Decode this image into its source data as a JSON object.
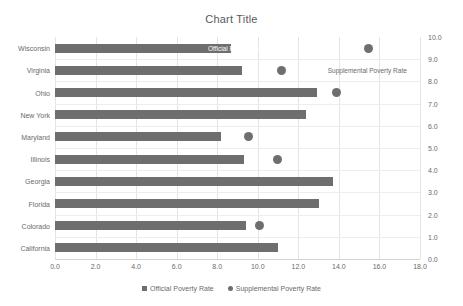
{
  "chart_data": {
    "type": "bar",
    "title": "Chart Title",
    "orientation": "horizontal",
    "xlabel": "",
    "ylabel": "",
    "grid": true,
    "legend_position": "bottom",
    "categories": [
      "Wisconsin",
      "Virginia",
      "Ohio",
      "New York",
      "Maryland",
      "Illinois",
      "Georgia",
      "Florida",
      "Colorado",
      "California"
    ],
    "series": [
      {
        "name": "Official Poverty Rate",
        "marker": "square",
        "axis": "primary",
        "color": "#6e6e6e",
        "values": [
          8.7,
          9.2,
          12.9,
          12.4,
          8.2,
          9.3,
          13.7,
          13.0,
          9.4,
          11.0
        ]
      },
      {
        "name": "Supplemental Poverty Rate",
        "marker": "circle",
        "axis": "secondary",
        "color": "#6e6e6e",
        "values": [
          8.6,
          6.2,
          7.7,
          6.7,
          5.3,
          6.1,
          7.5,
          null,
          5.6,
          null
        ]
      }
    ],
    "x_axis": {
      "min": 0.0,
      "max": 18.0,
      "step": 2.0,
      "ticks": [
        "0.0",
        "2.0",
        "4.0",
        "6.0",
        "8.0",
        "10.0",
        "12.0",
        "14.0",
        "16.0",
        "18.0"
      ],
      "tick_values": [
        0.0,
        2.0,
        4.0,
        6.0,
        8.0,
        10.0,
        12.0,
        14.0,
        16.0,
        18.0
      ]
    },
    "secondary_y_axis": {
      "min": 0.0,
      "max": 10.0,
      "step": 1.0,
      "ticks": [
        "0.0",
        "1.0",
        "2.0",
        "3.0",
        "4.0",
        "5.0",
        "6.0",
        "7.0",
        "8.0",
        "9.0",
        "10.0"
      ],
      "tick_values": [
        0.0,
        1.0,
        2.0,
        3.0,
        4.0,
        5.0,
        6.0,
        7.0,
        8.0,
        9.0,
        10.0
      ]
    },
    "annotations": [
      {
        "text": "Official Poverty Rate",
        "x": 9.0,
        "category": "Wisconsin"
      },
      {
        "text": "Supplemental Poverty Rate",
        "x": 15.4,
        "category": "Virginia"
      }
    ]
  },
  "legend": {
    "items": [
      {
        "label": "Official Poverty Rate",
        "marker": "square"
      },
      {
        "label": "Supplemental Poverty Rate",
        "marker": "circle"
      }
    ]
  },
  "colors": {
    "series": "#6e6e6e",
    "grid": "#e4e4e4",
    "text": "#6a6a6a",
    "title": "#5a5a5a",
    "background": "#ffffff"
  }
}
